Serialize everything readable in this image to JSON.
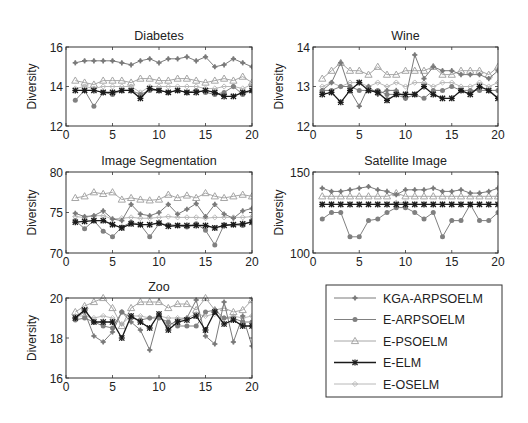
{
  "figure": {
    "legend": {
      "entries": [
        {
          "name": "KGA-ARPSOELM",
          "color": "#7a7a7a",
          "marker": "plus-star"
        },
        {
          "name": "E-ARPSOELM",
          "color": "#808080",
          "marker": "dot"
        },
        {
          "name": "E-PSOELM",
          "color": "#a6a6a6",
          "marker": "triangle"
        },
        {
          "name": "E-ELM",
          "color": "#1a1a1a",
          "marker": "star"
        },
        {
          "name": "E-OSELM",
          "color": "#b8b8b8",
          "marker": "diamond-plus"
        }
      ]
    }
  },
  "chart_data": [
    {
      "type": "line",
      "title": "Diabetes",
      "xlabel": "",
      "ylabel": "Diversity",
      "xlim": [
        0,
        20
      ],
      "ylim": [
        12,
        16
      ],
      "xticks": [
        0,
        5,
        10,
        15,
        20
      ],
      "yticks": [
        12,
        14,
        16
      ],
      "grid": false,
      "x": [
        1,
        2,
        3,
        4,
        5,
        6,
        7,
        8,
        9,
        10,
        11,
        12,
        13,
        14,
        15,
        16,
        17,
        18,
        19,
        20
      ],
      "series": [
        {
          "name": "KGA-ARPSOELM",
          "values": [
            15.2,
            15.3,
            15.3,
            15.3,
            15.3,
            15.2,
            15.1,
            15.3,
            15.4,
            15.2,
            15.4,
            15.4,
            15.5,
            15.3,
            15.5,
            15.0,
            15.1,
            15.4,
            15.2,
            15.0
          ]
        },
        {
          "name": "E-ARPSOELM",
          "values": [
            13.3,
            13.8,
            13.0,
            13.7,
            13.6,
            13.8,
            13.8,
            13.6,
            13.8,
            13.8,
            13.7,
            13.8,
            13.7,
            13.8,
            13.7,
            13.6,
            13.7,
            14.0,
            13.6,
            13.8
          ]
        },
        {
          "name": "E-PSOELM",
          "values": [
            14.3,
            14.2,
            14.1,
            14.3,
            14.3,
            14.3,
            14.2,
            14.4,
            14.4,
            14.3,
            14.3,
            14.4,
            14.4,
            14.3,
            14.2,
            14.3,
            14.4,
            14.3,
            14.5,
            14.2
          ]
        },
        {
          "name": "E-ELM",
          "values": [
            13.8,
            13.8,
            13.8,
            13.7,
            13.7,
            13.8,
            13.8,
            13.4,
            13.9,
            13.8,
            13.7,
            13.8,
            13.7,
            13.7,
            13.8,
            13.7,
            13.5,
            13.5,
            13.7,
            13.8
          ]
        },
        {
          "name": "E-OSELM",
          "values": [
            13.9,
            14.0,
            13.9,
            14.0,
            14.0,
            14.0,
            14.0,
            13.7,
            14.0,
            14.0,
            14.0,
            14.0,
            14.0,
            14.0,
            13.9,
            13.9,
            14.0,
            14.0,
            13.9,
            14.1
          ]
        }
      ]
    },
    {
      "type": "line",
      "title": "Wine",
      "xlabel": "",
      "ylabel": "Diversity",
      "xlim": [
        0,
        20
      ],
      "ylim": [
        12,
        14
      ],
      "xticks": [
        0,
        5,
        10,
        15,
        20
      ],
      "yticks": [
        12,
        13,
        14
      ],
      "grid": false,
      "x": [
        1,
        2,
        3,
        4,
        5,
        6,
        7,
        8,
        9,
        10,
        11,
        12,
        13,
        14,
        15,
        16,
        17,
        18,
        19,
        20
      ],
      "series": [
        {
          "name": "KGA-ARPSOELM",
          "values": [
            12.9,
            13.1,
            13.6,
            12.9,
            12.5,
            13.0,
            12.8,
            12.9,
            12.9,
            12.7,
            13.8,
            13.2,
            13.5,
            13.4,
            13.4,
            13.3,
            13.3,
            13.3,
            13.2,
            13.4
          ]
        },
        {
          "name": "E-ARPSOELM",
          "values": [
            12.9,
            12.9,
            13.0,
            13.0,
            12.9,
            12.9,
            12.9,
            12.8,
            12.8,
            12.7,
            12.8,
            12.7,
            12.9,
            12.9,
            13.0,
            12.9,
            12.9,
            12.9,
            12.9,
            12.9
          ]
        },
        {
          "name": "E-PSOELM",
          "values": [
            13.2,
            13.4,
            13.6,
            13.4,
            13.4,
            13.3,
            13.5,
            13.3,
            13.3,
            13.4,
            13.4,
            13.4,
            13.5,
            13.3,
            13.3,
            13.4,
            13.4,
            13.4,
            13.3,
            13.5
          ]
        },
        {
          "name": "E-ELM",
          "values": [
            12.8,
            12.85,
            12.6,
            12.9,
            13.1,
            12.9,
            12.85,
            12.65,
            12.8,
            12.8,
            12.8,
            13.0,
            12.8,
            12.7,
            12.7,
            12.9,
            12.8,
            13.0,
            12.9,
            12.7
          ]
        },
        {
          "name": "E-OSELM",
          "values": [
            13.0,
            13.1,
            13.0,
            13.1,
            13.1,
            13.0,
            13.1,
            13.0,
            13.1,
            13.0,
            13.1,
            13.1,
            13.0,
            13.1,
            13.1,
            13.0,
            13.0,
            13.1,
            13.0,
            13.1
          ]
        }
      ]
    },
    {
      "type": "line",
      "title": "Image Segmentation",
      "xlabel": "",
      "ylabel": "Diversity",
      "xlim": [
        0,
        20
      ],
      "ylim": [
        70,
        80
      ],
      "xticks": [
        0,
        5,
        10,
        15,
        20
      ],
      "yticks": [
        70,
        75,
        80
      ],
      "grid": false,
      "x": [
        1,
        2,
        3,
        4,
        5,
        6,
        7,
        8,
        9,
        10,
        11,
        12,
        13,
        14,
        15,
        16,
        17,
        18,
        19,
        20
      ],
      "series": [
        {
          "name": "KGA-ARPSOELM",
          "values": [
            74.9,
            74.5,
            74.6,
            75.2,
            74.2,
            74.0,
            76.0,
            74.8,
            74.6,
            75.0,
            76.0,
            74.8,
            75.4,
            76.1,
            74.5,
            76.0,
            74.8,
            74.3,
            75.2,
            75.5
          ]
        },
        {
          "name": "E-ARPSOELM",
          "values": [
            74.0,
            73.0,
            74.0,
            72.7,
            72.0,
            73.2,
            73.8,
            73.5,
            72.0,
            73.6,
            73.5,
            73.4,
            73.2,
            73.6,
            72.8,
            71.0,
            73.5,
            73.5,
            73.4,
            74.0
          ]
        },
        {
          "name": "E-PSOELM",
          "values": [
            76.8,
            77.0,
            77.5,
            77.3,
            77.5,
            76.6,
            76.8,
            76.6,
            76.5,
            76.6,
            77.2,
            76.8,
            77.1,
            76.8,
            77.4,
            77.0,
            76.8,
            77.0,
            77.2,
            77.0
          ]
        },
        {
          "name": "E-ELM",
          "values": [
            73.8,
            73.9,
            74.0,
            74.0,
            73.5,
            73.1,
            73.6,
            73.5,
            73.5,
            73.7,
            73.3,
            73.4,
            73.4,
            73.4,
            73.4,
            73.1,
            73.4,
            73.5,
            73.6,
            73.8
          ]
        },
        {
          "name": "E-OSELM",
          "values": [
            74.5,
            74.4,
            74.6,
            74.6,
            74.2,
            74.3,
            74.4,
            74.3,
            74.3,
            74.4,
            74.5,
            74.4,
            74.4,
            74.4,
            74.3,
            74.4,
            74.4,
            74.4,
            74.4,
            74.5
          ]
        }
      ]
    },
    {
      "type": "line",
      "title": "Satellite Image",
      "xlabel": "",
      "ylabel": "Diversity",
      "xlim": [
        0,
        20
      ],
      "ylim": [
        100,
        150
      ],
      "xticks": [
        0,
        5,
        10,
        15,
        20
      ],
      "yticks": [
        100,
        150
      ],
      "grid": false,
      "x": [
        1,
        2,
        3,
        4,
        5,
        6,
        7,
        8,
        9,
        10,
        11,
        12,
        13,
        14,
        15,
        16,
        17,
        18,
        19,
        20
      ],
      "series": [
        {
          "name": "KGA-ARPSOELM",
          "values": [
            140,
            138,
            138,
            139,
            140,
            141,
            139,
            138,
            136,
            139,
            139,
            139,
            140,
            138,
            138,
            139,
            137,
            137,
            138,
            140
          ]
        },
        {
          "name": "E-ARPSOELM",
          "values": [
            121,
            125,
            125,
            110,
            110,
            120,
            121,
            125,
            128,
            128,
            125,
            121,
            125,
            110,
            120,
            120,
            130,
            120,
            120,
            125
          ]
        },
        {
          "name": "E-PSOELM",
          "values": [
            135,
            135,
            135,
            135,
            135,
            135,
            135,
            135,
            137,
            135,
            135,
            135,
            135,
            135,
            135,
            135,
            135,
            135,
            135,
            135
          ]
        },
        {
          "name": "E-ELM",
          "values": [
            130,
            130,
            130,
            130,
            130,
            130,
            130,
            130,
            130,
            130,
            130,
            130,
            130,
            130,
            130,
            130,
            130,
            130,
            130,
            130
          ]
        },
        {
          "name": "E-OSELM",
          "values": [
            130,
            130,
            130,
            130,
            130,
            130,
            130,
            130,
            131,
            131,
            130,
            130,
            130,
            130,
            130,
            130,
            130,
            130,
            130,
            130
          ]
        }
      ]
    },
    {
      "type": "line",
      "title": "Zoo",
      "xlabel": "",
      "ylabel": "Diversity",
      "xlim": [
        0,
        20
      ],
      "ylim": [
        16,
        20
      ],
      "xticks": [
        0,
        5,
        10,
        15,
        20
      ],
      "yticks": [
        16,
        18,
        20
      ],
      "grid": false,
      "x": [
        1,
        2,
        3,
        4,
        5,
        6,
        7,
        8,
        9,
        10,
        11,
        12,
        13,
        14,
        15,
        16,
        17,
        18,
        19,
        20
      ],
      "series": [
        {
          "name": "KGA-ARPSOELM",
          "values": [
            19.0,
            19.3,
            18.1,
            17.8,
            18.3,
            19.3,
            18.8,
            18.4,
            17.4,
            19.1,
            18.6,
            18.9,
            19.0,
            19.9,
            18.1,
            17.7,
            19.8,
            17.8,
            19.1,
            17.6
          ]
        },
        {
          "name": "E-ARPSOELM",
          "values": [
            18.9,
            19.0,
            18.8,
            18.6,
            18.5,
            19.3,
            19.0,
            18.9,
            19.0,
            19.0,
            18.8,
            18.6,
            18.6,
            18.6,
            19.3,
            19.4,
            19.0,
            19.0,
            18.8,
            18.8
          ]
        },
        {
          "name": "E-PSOELM",
          "values": [
            19.3,
            19.6,
            19.8,
            20.0,
            19.5,
            18.6,
            19.5,
            19.8,
            19.8,
            19.8,
            19.5,
            19.7,
            19.7,
            19.4,
            20.0,
            19.4,
            19.5,
            19.3,
            19.4,
            19.9
          ]
        },
        {
          "name": "E-ELM",
          "values": [
            19.0,
            19.4,
            18.8,
            18.8,
            18.8,
            18.0,
            19.1,
            18.8,
            18.5,
            19.2,
            18.4,
            18.8,
            18.9,
            19.1,
            18.4,
            19.3,
            18.7,
            18.9,
            18.6,
            18.6
          ]
        },
        {
          "name": "E-OSELM",
          "values": [
            19.1,
            19.1,
            19.0,
            19.1,
            19.0,
            18.7,
            19.1,
            19.1,
            19.0,
            19.1,
            19.0,
            19.0,
            19.0,
            19.2,
            19.1,
            19.2,
            19.0,
            19.1,
            19.0,
            19.1
          ]
        }
      ]
    }
  ],
  "layout_slots": [
    {
      "x0": 66,
      "x1": 252,
      "y0": 47,
      "y1": 126
    },
    {
      "x0": 313,
      "x1": 498,
      "y0": 47,
      "y1": 126
    },
    {
      "x0": 66,
      "x1": 252,
      "y0": 172,
      "y1": 253
    },
    {
      "x0": 313,
      "x1": 498,
      "y0": 172,
      "y1": 253
    },
    {
      "x0": 66,
      "x1": 252,
      "y0": 298,
      "y1": 378
    }
  ],
  "legend_box": {
    "x": 326,
    "y": 285,
    "w": 176,
    "h": 112
  }
}
